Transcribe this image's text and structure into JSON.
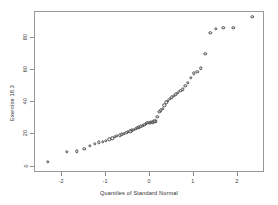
{
  "chart_data": {
    "type": "scatter",
    "title": "",
    "xlabel": "Quantiles of Standard Normal",
    "ylabel": "Exercise 18.3",
    "xlim": [
      -2.62,
      2.62
    ],
    "ylim": [
      -4.0,
      96.0
    ],
    "xticks": [
      -2,
      -1,
      0,
      1,
      2
    ],
    "xticklabels": [
      "-2",
      "-1",
      "0",
      "1",
      "2"
    ],
    "yticks": [
      0,
      20,
      40,
      60,
      80
    ],
    "yticklabels": [
      "0",
      "20",
      "40",
      "60",
      "80"
    ],
    "grid": false,
    "legend": null,
    "marker": "open-circle",
    "marker_color": "#4a4a4a",
    "series": [
      {
        "name": "Exercise 18.3",
        "x": [
          -2.33,
          -1.9,
          -1.67,
          -1.5,
          -1.37,
          -1.26,
          -1.16,
          -1.08,
          -1.0,
          -0.93,
          -0.86,
          -0.8,
          -0.75,
          -0.69,
          -0.64,
          -0.59,
          -0.54,
          -0.5,
          -0.45,
          -0.41,
          -0.37,
          -0.33,
          -0.29,
          -0.25,
          -0.21,
          -0.17,
          -0.13,
          -0.1,
          -0.06,
          -0.02,
          0.02,
          0.06,
          0.1,
          0.13,
          0.17,
          0.21,
          0.25,
          0.29,
          0.33,
          0.37,
          0.41,
          0.45,
          0.5,
          0.54,
          0.59,
          0.64,
          0.69,
          0.75,
          0.8,
          0.86,
          0.93,
          1.0,
          1.08,
          1.16,
          1.26,
          1.37,
          1.5,
          1.67,
          1.9,
          2.33
        ],
        "y": [
          3,
          9,
          9.5,
          11,
          13,
          14,
          15,
          15.5,
          16,
          17,
          17.5,
          18.5,
          19,
          19.5,
          20,
          20.5,
          21,
          21.5,
          22,
          22.5,
          23,
          23.5,
          24,
          24.5,
          25,
          25.5,
          26,
          26.5,
          27,
          27,
          27.5,
          27.5,
          28,
          28,
          31,
          34,
          35,
          36,
          38,
          40,
          41,
          42,
          43,
          44,
          45,
          46,
          47,
          48,
          50,
          52,
          55,
          58,
          59,
          61,
          70,
          83,
          85.5,
          86,
          86,
          93
        ]
      }
    ]
  },
  "axes": {
    "x_axis_label": "Quantiles of Standard Normal",
    "y_axis_label": "Exercise 18.3"
  }
}
